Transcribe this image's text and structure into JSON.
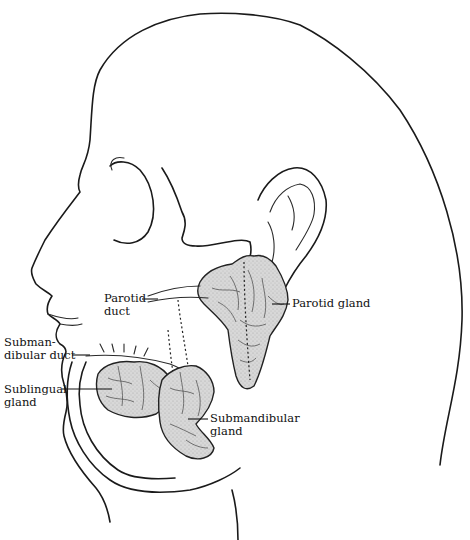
{
  "figure": {
    "type": "anatomical illustration",
    "gland_fill": "#d4d4d4",
    "line_color": "#1a1a1a",
    "labels": {
      "parotid_duct": "Parotid\nduct",
      "parotid_gland": "Parotid gland",
      "submandibular_duct": "Submandibular duct",
      "sublingual_gland": "Sublingual\ngland",
      "submandibular_gland": "Submandibular\ngland"
    }
  }
}
